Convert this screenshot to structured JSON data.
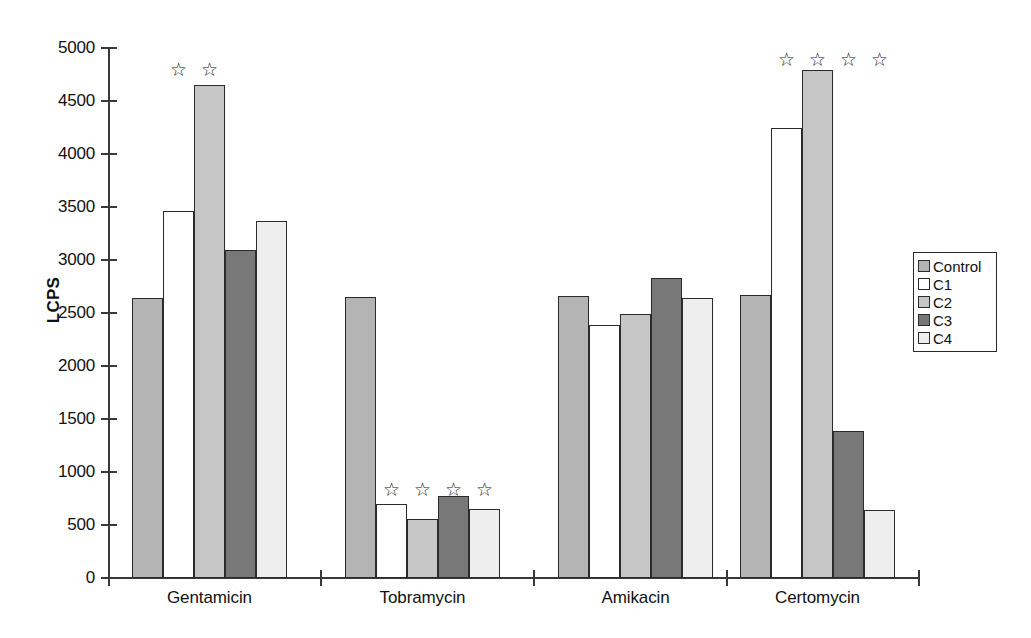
{
  "chart_data": {
    "type": "bar",
    "title": "",
    "xlabel": "",
    "ylabel": "LCPS",
    "ylim": [
      0,
      5000
    ],
    "ytick_labels": [
      "5000",
      "4500",
      "4000",
      "3500",
      "3000",
      "2500",
      "2000",
      "1500",
      "1000",
      "500",
      "0"
    ],
    "ytick_values": [
      5000,
      4500,
      4000,
      3500,
      3000,
      2500,
      2000,
      1500,
      1000,
      500,
      0
    ],
    "grid": false,
    "legend_position": "right",
    "categories": [
      "Gentamicin",
      "Tobramycin",
      "Amikacin",
      "Certomycin"
    ],
    "series": [
      {
        "name": "Control",
        "color": "#b4b4b4",
        "values": [
          2640,
          2650,
          2660,
          2670
        ]
      },
      {
        "name": "C1",
        "color": "#ffffff",
        "values": [
          3465,
          695,
          2390,
          4245
        ]
      },
      {
        "name": "C2",
        "color": "#c6c6c6",
        "values": [
          4650,
          555,
          2490,
          4790
        ]
      },
      {
        "name": "C3",
        "color": "#787878",
        "values": [
          3090,
          770,
          2830,
          1390
        ]
      },
      {
        "name": "C4",
        "color": "#eeeeee",
        "values": [
          3370,
          650,
          2645,
          645
        ]
      }
    ],
    "significance_markers": {
      "glyph": "☆",
      "marked": [
        {
          "category": "Gentamicin",
          "series": [
            "C1",
            "C2"
          ]
        },
        {
          "category": "Tobramycin",
          "series": [
            "C1",
            "C2",
            "C3",
            "C4"
          ]
        },
        {
          "category": "Amikacin",
          "series": []
        },
        {
          "category": "Certomycin",
          "series": [
            "C1",
            "C2",
            "C3",
            "C4"
          ]
        }
      ]
    },
    "star_rows": {
      "Gentamicin": 60,
      "Tobramycin": 480,
      "Certomycin": 50
    }
  },
  "legend": {
    "items": [
      "Control",
      "C1",
      "C2",
      "C3",
      "C4"
    ]
  },
  "axis": {
    "y_title": "LCPS"
  },
  "colors": {
    "control": "#b4b4b4",
    "c1": "#ffffff",
    "c2": "#c6c6c6",
    "c3": "#787878",
    "c4": "#eeeeee",
    "axis": "#3a3a3a",
    "bar_outline": "#2b2b2b",
    "background": "#ffffff"
  }
}
